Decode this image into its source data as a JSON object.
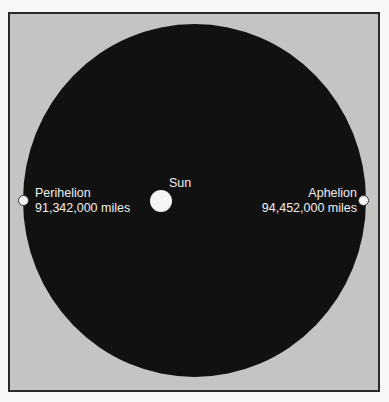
{
  "diagram": {
    "sun": {
      "label": "Sun"
    },
    "perihelion": {
      "label": "Perihelion",
      "distance": "91,342,000 miles"
    },
    "aphelion": {
      "label": "Aphelion",
      "distance": "94,452,000 miles"
    },
    "colors": {
      "background": "#c4c4c2",
      "orbit_fill": "#111111",
      "points": "#f5f5f5",
      "text": "#f0f0f0"
    }
  }
}
